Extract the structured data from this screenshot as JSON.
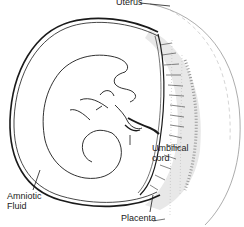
{
  "diagram": {
    "labels": {
      "uterus": "Uterus",
      "umbilical_cord_line1": "Umbilical",
      "umbilical_cord_line2": "cord",
      "amniotic_fluid_line1": "Amniotic",
      "amniotic_fluid_line2": "Fluid",
      "placenta": "Placenta"
    },
    "colors": {
      "line": "#1a1a1a",
      "background": "#ffffff",
      "stipple": "#555555"
    }
  }
}
